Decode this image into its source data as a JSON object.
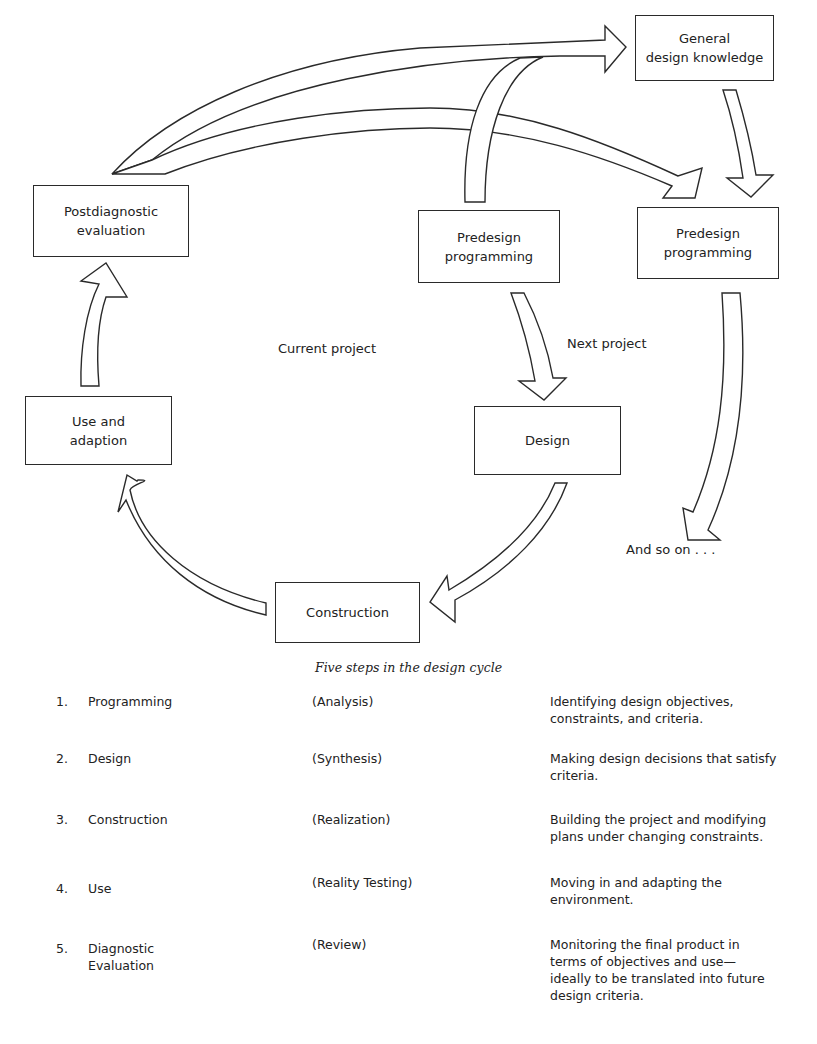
{
  "diagram": {
    "nodes": {
      "general_knowledge": "General\ndesign knowledge",
      "postdiagnostic": "Postdiagnostic\nevaluation",
      "predesign_current": "Predesign\nprogramming",
      "predesign_next": "Predesign\nprogramming",
      "use_adaption": "Use and\nadaption",
      "design": "Design",
      "construction": "Construction"
    },
    "labels": {
      "current_project": "Current project",
      "next_project": "Next project",
      "and_so_on": "And so on . . ."
    },
    "edges": [
      {
        "from": "postdiagnostic",
        "to": "general_knowledge"
      },
      {
        "from": "postdiagnostic",
        "to": "predesign_next"
      },
      {
        "from": "predesign_current",
        "to": "general_knowledge"
      },
      {
        "from": "general_knowledge",
        "to": "predesign_next"
      },
      {
        "from": "predesign_current",
        "to": "design"
      },
      {
        "from": "design",
        "to": "construction"
      },
      {
        "from": "construction",
        "to": "use_adaption"
      },
      {
        "from": "use_adaption",
        "to": "postdiagnostic"
      },
      {
        "from": "predesign_next",
        "to": "and_so_on"
      }
    ]
  },
  "caption": "Five steps in the design cycle",
  "steps": [
    {
      "num": "1.",
      "name": "Programming",
      "phase": "(Analysis)",
      "desc": "Identifying design objectives, constraints, and criteria."
    },
    {
      "num": "2.",
      "name": "Design",
      "phase": "(Synthesis)",
      "desc": "Making design decisions that satisfy criteria."
    },
    {
      "num": "3.",
      "name": "Construction",
      "phase": "(Realization)",
      "desc": "Building the project and modifying plans under changing constraints."
    },
    {
      "num": "4.",
      "name": "Use",
      "phase": "(Reality Testing)",
      "desc": "Moving in and adapting the environment."
    },
    {
      "num": "5.",
      "name": "Diagnostic Evaluation",
      "phase": "(Review)",
      "desc": "Monitoring the final product in terms of objectives and use—ideally to be translated into future design criteria."
    }
  ]
}
